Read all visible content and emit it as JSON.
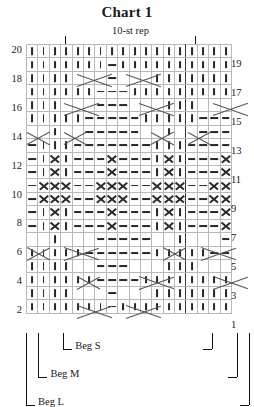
{
  "title": "Chart 1",
  "repeat": {
    "label": "10-st rep"
  },
  "row_labels": {
    "left": [
      "20",
      "18",
      "16",
      "14",
      "12",
      "10",
      "8",
      "6",
      "4",
      "2"
    ],
    "right": [
      "19",
      "17",
      "15",
      "13",
      "11",
      "9",
      "7",
      "5",
      "3",
      "1"
    ]
  },
  "brackets": {
    "left": [
      {
        "label": "Beg S"
      },
      {
        "label": "Beg M"
      },
      {
        "label": "Beg L"
      }
    ],
    "right": [
      {
        "label": "Beg S"
      },
      {
        "label": "Beg M"
      },
      {
        "label": "Beg L"
      }
    ]
  },
  "legend_symbols": {
    "k": "knit-stitch",
    "p": "purl-stitch",
    "x": "cross-stitch",
    "c": "cable-cross"
  },
  "chart_data": {
    "type": "table",
    "title": "Chart 1",
    "columns": 18,
    "rows": 20,
    "repeat_span": [
      4,
      13
    ],
    "repeat_label": "10-st rep",
    "row_numbers_left": [
      20,
      18,
      16,
      14,
      12,
      10,
      8,
      6,
      4,
      2
    ],
    "row_numbers_right": [
      19,
      17,
      15,
      13,
      11,
      9,
      7,
      5,
      3,
      1
    ],
    "symbol_key": {
      "k": "knit (vertical bar)",
      "p": "purl (horizontal dash)",
      "x": "cross (X)",
      "-": "empty / covered by cable line"
    },
    "grid": [
      [
        "k",
        "k",
        "k",
        "k",
        "k",
        "k",
        "k",
        "p",
        "k",
        "k",
        "k",
        "k",
        "k",
        "k",
        "k",
        "k",
        "k",
        "k"
      ],
      [
        "k",
        "k",
        "k",
        "k",
        "c",
        "c",
        "c",
        "p",
        "c",
        "c",
        "c",
        "k",
        "k",
        "k",
        "k",
        "k",
        "k",
        "k"
      ],
      [
        "k",
        "k",
        "k",
        "k",
        "k",
        "k",
        "p",
        "p",
        "p",
        "p",
        "k",
        "k",
        "k",
        "k",
        "k",
        "k",
        "k",
        "k"
      ],
      [
        "k",
        "k",
        "k",
        "k",
        "c",
        "c",
        "p",
        "p",
        "p",
        "c",
        "c",
        "c",
        "k",
        "k",
        "k",
        "c",
        "c",
        "c"
      ],
      [
        "k",
        "k",
        "k",
        "k",
        "k",
        "p",
        "p",
        "p",
        "p",
        "p",
        "p",
        "k",
        "k",
        "k",
        "k",
        "k",
        "p",
        "p"
      ],
      [
        "c",
        "c",
        "k",
        "c",
        "c",
        "c",
        "p",
        "p",
        "p",
        "p",
        "p",
        "c",
        "c",
        "k",
        "c",
        "c",
        "c",
        "p"
      ],
      [
        "p",
        "k",
        "x",
        "k",
        "p",
        "p",
        "p",
        "x",
        "p",
        "p",
        "p",
        "k",
        "x",
        "k",
        "p",
        "p",
        "p",
        "x"
      ],
      [
        "p",
        "k",
        "x",
        "k",
        "p",
        "p",
        "p",
        "x",
        "p",
        "p",
        "p",
        "k",
        "x",
        "k",
        "p",
        "p",
        "p",
        "x"
      ],
      [
        "p",
        "x",
        "x",
        "x",
        "p",
        "p",
        "x",
        "x",
        "x",
        "p",
        "p",
        "x",
        "x",
        "x",
        "p",
        "p",
        "x",
        "x"
      ],
      [
        "p",
        "x",
        "x",
        "x",
        "p",
        "p",
        "x",
        "x",
        "x",
        "p",
        "p",
        "x",
        "x",
        "x",
        "p",
        "p",
        "x",
        "x"
      ],
      [
        "p",
        "k",
        "x",
        "k",
        "p",
        "p",
        "p",
        "x",
        "p",
        "p",
        "p",
        "k",
        "x",
        "k",
        "p",
        "p",
        "p",
        "x"
      ],
      [
        "p",
        "k",
        "x",
        "k",
        "p",
        "p",
        "p",
        "x",
        "p",
        "p",
        "p",
        "k",
        "x",
        "k",
        "p",
        "p",
        "p",
        "x"
      ],
      [
        "p",
        "k",
        "k",
        "k",
        "p",
        "p",
        "p",
        "p",
        "p",
        "p",
        "p",
        "k",
        "k",
        "k",
        "p",
        "p",
        "p",
        "p"
      ],
      [
        "c",
        "c",
        "k",
        "c",
        "c",
        "p",
        "p",
        "p",
        "p",
        "p",
        "c",
        "c",
        "k",
        "c",
        "c",
        "p",
        "p",
        "p"
      ],
      [
        "k",
        "k",
        "k",
        "k",
        "k",
        "p",
        "p",
        "p",
        "p",
        "p",
        "k",
        "k",
        "k",
        "k",
        "k",
        "p",
        "p",
        "p"
      ],
      [
        "k",
        "k",
        "k",
        "c",
        "c",
        "c",
        "p",
        "p",
        "p",
        "c",
        "c",
        "c",
        "k",
        "k",
        "k",
        "c",
        "c",
        "c"
      ],
      [
        "k",
        "k",
        "k",
        "k",
        "k",
        "k",
        "p",
        "p",
        "p",
        "k",
        "k",
        "k",
        "k",
        "k",
        "k",
        "k",
        "k",
        "k"
      ],
      [
        "k",
        "k",
        "k",
        "k",
        "c",
        "c",
        "c",
        "p",
        "c",
        "c",
        "c",
        "k",
        "k",
        "k",
        "k",
        "k",
        "k",
        "k"
      ],
      [
        "k",
        "k",
        "k",
        "k",
        "k",
        "k",
        "k",
        "p",
        "k",
        "k",
        "k",
        "k",
        "k",
        "k",
        "k",
        "k",
        "k",
        "k"
      ],
      [
        "k",
        "k",
        "k",
        "k",
        "k",
        "k",
        "k",
        "k",
        "k",
        "k",
        "k",
        "k",
        "k",
        "k",
        "k",
        "k",
        "k",
        "k"
      ]
    ]
  }
}
